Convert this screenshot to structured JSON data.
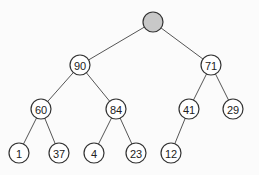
{
  "tree": {
    "nodes": [
      {
        "id": "root",
        "label": "",
        "x": 153,
        "y": 22,
        "highlighted": true
      },
      {
        "id": "n90",
        "label": "90",
        "x": 80,
        "y": 65
      },
      {
        "id": "n71",
        "label": "71",
        "x": 211,
        "y": 65
      },
      {
        "id": "n60",
        "label": "60",
        "x": 41,
        "y": 109
      },
      {
        "id": "n84",
        "label": "84",
        "x": 116,
        "y": 109
      },
      {
        "id": "n41",
        "label": "41",
        "x": 189,
        "y": 109
      },
      {
        "id": "n29",
        "label": "29",
        "x": 233,
        "y": 109
      },
      {
        "id": "n1",
        "label": "1",
        "x": 19,
        "y": 153
      },
      {
        "id": "n37",
        "label": "37",
        "x": 59,
        "y": 153
      },
      {
        "id": "n4",
        "label": "4",
        "x": 94,
        "y": 153
      },
      {
        "id": "n23",
        "label": "23",
        "x": 136,
        "y": 153
      },
      {
        "id": "n12",
        "label": "12",
        "x": 171,
        "y": 153
      }
    ],
    "edges": [
      [
        "root",
        "n90"
      ],
      [
        "root",
        "n71"
      ],
      [
        "n90",
        "n60"
      ],
      [
        "n90",
        "n84"
      ],
      [
        "n71",
        "n41"
      ],
      [
        "n71",
        "n29"
      ],
      [
        "n60",
        "n1"
      ],
      [
        "n60",
        "n37"
      ],
      [
        "n84",
        "n4"
      ],
      [
        "n84",
        "n23"
      ],
      [
        "n41",
        "n12"
      ]
    ],
    "node_radius": 10,
    "colors": {
      "root_fill": "#c8c8c8",
      "node_fill": "#ffffff",
      "stroke": "#333333",
      "background": "#fbfbfb"
    }
  }
}
